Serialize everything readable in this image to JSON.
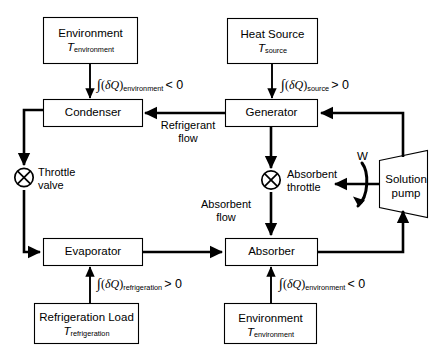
{
  "diagram": {
    "stroke_color": "#000000",
    "background_color": "#ffffff",
    "nodes": {
      "environment_top": {
        "line1": "Environment",
        "symbol": "T",
        "subscript": "environment"
      },
      "heat_source": {
        "line1": "Heat Source",
        "symbol": "T",
        "subscript": "source"
      },
      "condenser": {
        "label": "Condenser"
      },
      "generator": {
        "label": "Generator"
      },
      "evaporator": {
        "label": "Evaporator"
      },
      "absorber": {
        "label": "Absorber"
      },
      "refrigeration_load": {
        "line1": "Refrigeration Load",
        "symbol": "T",
        "subscript": "refrigeration"
      },
      "environment_bottom": {
        "line1": "Environment",
        "symbol": "T",
        "subscript": "environment"
      },
      "solution_pump": {
        "line1": "Solution",
        "line2": "pump"
      },
      "throttle_valve": {
        "line1": "Throttle",
        "line2": "valve"
      },
      "absorbent_throttle": {
        "line1": "Absorbent",
        "line2": "throttle"
      }
    },
    "heat_labels": {
      "condenser_env": {
        "integral": "∫",
        "open": "(",
        "delta": "δ",
        "q": "Q",
        "close": ")",
        "subscript": "environment",
        "relation": "< 0"
      },
      "generator_source": {
        "integral": "∫",
        "open": "(",
        "delta": "δ",
        "q": "Q",
        "close": ")",
        "subscript": "source",
        "relation": "> 0"
      },
      "evaporator_refrigeration": {
        "integral": "∫",
        "open": "(",
        "delta": "δ",
        "q": "Q",
        "close": ")",
        "subscript": "refrigeration",
        "relation": "> 0"
      },
      "absorber_env": {
        "integral": "∫",
        "open": "(",
        "delta": "δ",
        "q": "Q",
        "close": ")",
        "subscript": "environment",
        "relation": "< 0"
      }
    },
    "flow_labels": {
      "refrigerant_flow": {
        "line1": "Refrigerant",
        "line2": "flow"
      },
      "absorbent_flow": {
        "line1": "Absorbent",
        "line2": "flow"
      },
      "work_input": {
        "label": "W"
      }
    }
  }
}
